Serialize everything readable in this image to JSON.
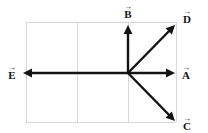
{
  "figure": {
    "background_color": "#ffffff",
    "width": 208,
    "height": 133
  },
  "grid": {
    "color": "#d8d8d8",
    "x_left": 26,
    "x_right": 176,
    "y_top": 22,
    "y_bottom": 122,
    "vertical_lines": [
      77,
      128
    ],
    "horizontal_lines": [
      73
    ],
    "columns": 3,
    "rows": 2
  },
  "origin": {
    "x": 128,
    "y": 73,
    "label": ""
  },
  "vectors": [
    {
      "id": "A",
      "letter": "A",
      "arrow_glyph": "→",
      "color": "#141414",
      "x1": 128,
      "y1": 73,
      "x2": 175,
      "y2": 73,
      "direction": "right",
      "angle_deg": 0,
      "label_x": 186,
      "label_y": 73
    },
    {
      "id": "B",
      "letter": "B",
      "arrow_glyph": "→",
      "color": "#141414",
      "x1": 128,
      "y1": 73,
      "x2": 128,
      "y2": 25,
      "direction": "up",
      "angle_deg": 90,
      "label_x": 128,
      "label_y": 12
    },
    {
      "id": "C",
      "letter": "C",
      "arrow_glyph": "→",
      "color": "#141414",
      "x1": 128,
      "y1": 73,
      "x2": 175,
      "y2": 121,
      "direction": "down-right",
      "angle_deg": -45,
      "label_x": 187,
      "label_y": 124
    },
    {
      "id": "D",
      "letter": "D",
      "arrow_glyph": "→",
      "color": "#141414",
      "x1": 128,
      "y1": 73,
      "x2": 175,
      "y2": 25,
      "direction": "up-right",
      "angle_deg": 45,
      "label_x": 187,
      "label_y": 17
    },
    {
      "id": "E",
      "letter": "E",
      "arrow_glyph": "→",
      "color": "#141414",
      "x1": 128,
      "y1": 73,
      "x2": 23,
      "y2": 73,
      "direction": "left",
      "angle_deg": 180,
      "label_x": 12,
      "label_y": 73
    }
  ]
}
